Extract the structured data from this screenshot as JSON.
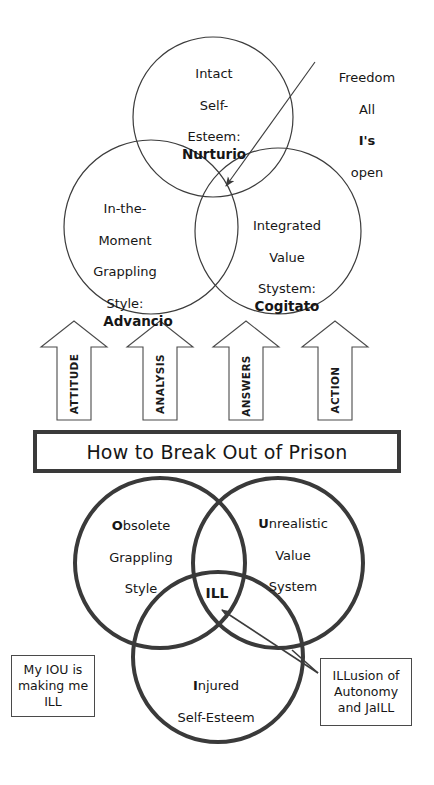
{
  "diagram": {
    "title": "How to Break Out of Prison",
    "top_venn": {
      "name": "freedom-venn",
      "circles": [
        {
          "id": "intact-self-esteem",
          "lines": [
            "Intact",
            "Self-",
            "Esteem:"
          ],
          "term": "Nurturio",
          "initial": "I"
        },
        {
          "id": "in-the-moment-grappling-style",
          "lines": [
            "In-the-",
            "Moment",
            "Grappling",
            "Style:"
          ],
          "term": "Advancio",
          "initial": "I"
        },
        {
          "id": "integrated-value-stystem",
          "lines": [
            "Integrated",
            "Value",
            "Stystem:"
          ],
          "term": "Cogitato",
          "initial": "I"
        }
      ],
      "annotation": {
        "lines": [
          "Freedom",
          "All",
          "I's",
          "open"
        ],
        "bold_word": "I"
      }
    },
    "arrows": [
      {
        "id": "attitude",
        "label": "ATTITUDE"
      },
      {
        "id": "analysis",
        "label": "ANALYSIS"
      },
      {
        "id": "answers",
        "label": "ANSWERS"
      },
      {
        "id": "action",
        "label": "ACTION"
      }
    ],
    "banner": {
      "label": "How to Break Out of Prison"
    },
    "bottom_venn": {
      "name": "ill-venn",
      "circles": [
        {
          "id": "obsolete-grappling-style",
          "initial": "O",
          "rest_first_line": "bsolete",
          "lines": [
            "Grappling",
            "Style"
          ]
        },
        {
          "id": "unrealistic-value-system",
          "initial": "U",
          "rest_first_line": "nrealistic",
          "lines": [
            "Value",
            "System"
          ]
        },
        {
          "id": "injured-self-esteem",
          "initial": "I",
          "rest_first_line": "njured",
          "lines": [
            "Self-Esteem"
          ]
        }
      ],
      "center_label": "ILL"
    },
    "callouts": [
      {
        "id": "iou-callout",
        "lines": [
          "My IOU is",
          "making me",
          "ILL"
        ]
      },
      {
        "id": "illusion-callout",
        "bold_prefix": "ILL",
        "rest_first_line": "usion of",
        "lines": [
          "Autonomy",
          "and JaILL"
        ]
      }
    ],
    "colors": {
      "stroke_thin": "#3c3c3c",
      "stroke_thick": "#3a3a3a",
      "text": "#161616",
      "background": "#ffffff"
    }
  }
}
